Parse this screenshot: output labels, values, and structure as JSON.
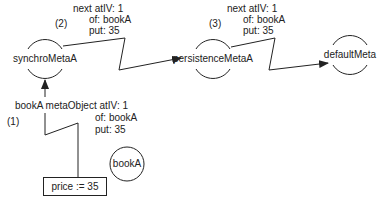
{
  "diagram": {
    "nodes": {
      "synchro": {
        "label": "synchroMetaA"
      },
      "persistence": {
        "label": "persistenceMetaA"
      },
      "default": {
        "label": "defaultMeta"
      },
      "book": {
        "label": "bookA"
      }
    },
    "statement_box": {
      "label": "price := 35"
    },
    "steps": {
      "step1": {
        "number": "(1)",
        "line1": "bookA metaObject atIV: 1",
        "line2": "of: bookA",
        "line3": "put: 35"
      },
      "step2": {
        "number": "(2)",
        "line1": "next atIV: 1",
        "line2": "of: bookA",
        "line3": "put: 35"
      },
      "step3": {
        "number": "(3)",
        "line1": "next atIV: 1",
        "line2": "of: bookA",
        "line3": "put: 35"
      }
    },
    "colors": {
      "stroke": "#222222",
      "background": "#ffffff"
    }
  }
}
